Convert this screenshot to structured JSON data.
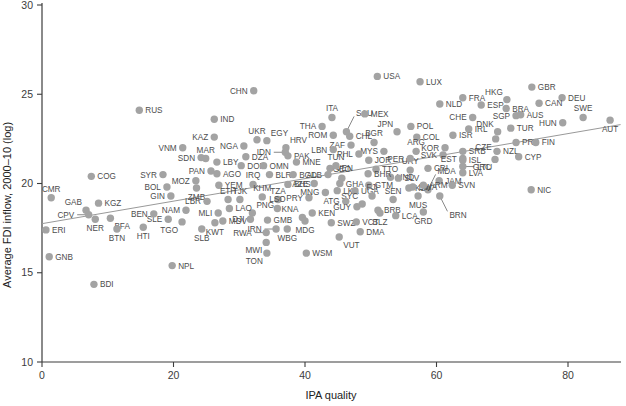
{
  "figure": {
    "x_axis_label": "IPA quality",
    "y_axis_label": "Average FDI inflow, 2000–10 (log)"
  },
  "chart_data": {
    "type": "scatter",
    "title": "",
    "xlabel": "IPA quality",
    "ylabel": "Average FDI inflow, 2000–10 (log)",
    "xlim": [
      0,
      88
    ],
    "ylim": [
      10,
      30
    ],
    "x_ticks": [
      0,
      20,
      40,
      60,
      80
    ],
    "y_ticks": [
      10,
      15,
      20,
      25,
      30
    ],
    "grid": false,
    "legend": "none",
    "dot_color": "#a3a3a3",
    "label_color": "#4d4d4d",
    "axis_color": "#3c3c3c",
    "trend_color": "#999999",
    "trend_line": {
      "x1": 0,
      "y1": 17.75,
      "x2": 88,
      "y2": 23.3
    },
    "points": [
      {
        "c": "ERI",
        "x": 0.6,
        "y": 17.4,
        "pos": "r"
      },
      {
        "c": "GNB",
        "x": 1.1,
        "y": 15.9,
        "pos": "r"
      },
      {
        "c": "CMR",
        "x": 1.4,
        "y": 19.2,
        "pos": "t"
      },
      {
        "c": "GAB",
        "x": 6.7,
        "y": 18.5,
        "pos": "tl"
      },
      {
        "c": "CPV",
        "x": 7.1,
        "y": 18.25,
        "pos": "l",
        "ld": true
      },
      {
        "c": "COG",
        "x": 7.5,
        "y": 20.4,
        "pos": "r"
      },
      {
        "c": "KGZ",
        "x": 8.6,
        "y": 18.9,
        "pos": "r"
      },
      {
        "c": "NER",
        "x": 8.1,
        "y": 18.0,
        "pos": "b"
      },
      {
        "c": "BFA",
        "x": 10.4,
        "y": 18.05,
        "pos": "br"
      },
      {
        "c": "BDI",
        "x": 7.9,
        "y": 14.35,
        "pos": "r"
      },
      {
        "c": "BTN",
        "x": 11.4,
        "y": 17.45,
        "pos": "b"
      },
      {
        "c": "HTI",
        "x": 15.4,
        "y": 17.55,
        "pos": "b"
      },
      {
        "c": "RUS",
        "x": 14.8,
        "y": 24.1,
        "pos": "r"
      },
      {
        "c": "SYR",
        "x": 18.4,
        "y": 20.5,
        "pos": "l"
      },
      {
        "c": "BOL",
        "x": 19.0,
        "y": 19.8,
        "pos": "l"
      },
      {
        "c": "GIN",
        "x": 19.6,
        "y": 19.3,
        "pos": "l"
      },
      {
        "c": "SLE",
        "x": 19.2,
        "y": 18.0,
        "pos": "l"
      },
      {
        "c": "BEN",
        "x": 17.0,
        "y": 18.3,
        "pos": "l"
      },
      {
        "c": "NAM",
        "x": 21.9,
        "y": 18.5,
        "pos": "l"
      },
      {
        "c": "VNM",
        "x": 21.4,
        "y": 22.0,
        "pos": "l"
      },
      {
        "c": "NPL",
        "x": 19.8,
        "y": 15.4,
        "pos": "r"
      },
      {
        "c": "TGO",
        "x": 21.3,
        "y": 17.85,
        "pos": "bl"
      },
      {
        "c": "SLB",
        "x": 24.3,
        "y": 17.45,
        "pos": "b"
      },
      {
        "c": "MOZ",
        "x": 23.4,
        "y": 20.15,
        "pos": "l"
      },
      {
        "c": "ZMB",
        "x": 23.5,
        "y": 19.75,
        "pos": "b"
      },
      {
        "c": "LBR",
        "x": 25.1,
        "y": 19.0,
        "pos": "l"
      },
      {
        "c": "MLI",
        "x": 26.8,
        "y": 18.35,
        "pos": "l"
      },
      {
        "c": "KWT",
        "x": 26.3,
        "y": 17.8,
        "pos": "b"
      },
      {
        "c": "MDV",
        "x": 27.5,
        "y": 17.9,
        "pos": "r"
      },
      {
        "c": "PAN",
        "x": 25.7,
        "y": 20.7,
        "pos": "l"
      },
      {
        "c": "AGO",
        "x": 26.6,
        "y": 20.55,
        "pos": "r"
      },
      {
        "c": "YEM",
        "x": 26.9,
        "y": 19.9,
        "pos": "r"
      },
      {
        "c": "MAR",
        "x": 24.9,
        "y": 21.4,
        "pos": "t"
      },
      {
        "c": "SDN",
        "x": 24.2,
        "y": 21.45,
        "pos": "l"
      },
      {
        "c": "LBY",
        "x": 26.6,
        "y": 21.2,
        "pos": "r"
      },
      {
        "c": "KAZ",
        "x": 26.2,
        "y": 22.6,
        "pos": "l"
      },
      {
        "c": "IND",
        "x": 26.2,
        "y": 23.6,
        "pos": "r"
      },
      {
        "c": "CHN",
        "x": 32.2,
        "y": 25.2,
        "pos": "l"
      },
      {
        "c": "NGA",
        "x": 30.7,
        "y": 22.1,
        "pos": "l"
      },
      {
        "c": "UKR",
        "x": 32.7,
        "y": 22.45,
        "pos": "t"
      },
      {
        "c": "EGY",
        "x": 34.2,
        "y": 22.4,
        "pos": "tr"
      },
      {
        "c": "DZA",
        "x": 31.0,
        "y": 21.5,
        "pos": "r"
      },
      {
        "c": "DOM",
        "x": 30.3,
        "y": 21.0,
        "pos": "r"
      },
      {
        "c": "IDN",
        "x": 37.0,
        "y": 21.75,
        "pos": "l",
        "ld": true
      },
      {
        "c": "HRV",
        "x": 37.1,
        "y": 22.0,
        "pos": "tr"
      },
      {
        "c": "PAK",
        "x": 37.4,
        "y": 21.55,
        "pos": "r"
      },
      {
        "c": "OMN",
        "x": 33.7,
        "y": 21.0,
        "pos": "r"
      },
      {
        "c": "MNE",
        "x": 38.7,
        "y": 21.2,
        "pos": "r"
      },
      {
        "c": "BLR",
        "x": 34.6,
        "y": 20.5,
        "pos": "r"
      },
      {
        "c": "BGD",
        "x": 38.2,
        "y": 20.5,
        "pos": "r"
      },
      {
        "c": "IRQ",
        "x": 32.1,
        "y": 19.95,
        "pos": "t"
      },
      {
        "c": "ETH",
        "x": 28.3,
        "y": 19.1,
        "pos": "t"
      },
      {
        "c": "TJK",
        "x": 30.1,
        "y": 19.1,
        "pos": "t"
      },
      {
        "c": "KHM",
        "x": 33.5,
        "y": 19.25,
        "pos": "t"
      },
      {
        "c": "TZA",
        "x": 35.9,
        "y": 19.1,
        "pos": "t"
      },
      {
        "c": "LSO",
        "x": 35.8,
        "y": 18.6,
        "pos": "t"
      },
      {
        "c": "PNG",
        "x": 32.0,
        "y": 18.35,
        "pos": "tr"
      },
      {
        "c": "LAO",
        "x": 28.5,
        "y": 18.6,
        "pos": "r"
      },
      {
        "c": "DJI",
        "x": 31.7,
        "y": 18.0,
        "pos": "l"
      },
      {
        "c": "GMB",
        "x": 34.3,
        "y": 17.95,
        "pos": "r"
      },
      {
        "c": "KNA",
        "x": 39.6,
        "y": 18.1,
        "pos": "tl"
      },
      {
        "c": "IRN",
        "x": 35.6,
        "y": 17.45,
        "pos": "l",
        "ld": true
      },
      {
        "c": "RWA",
        "x": 34.1,
        "y": 17.25,
        "pos": "l",
        "ld": true
      },
      {
        "c": "WBG",
        "x": 37.3,
        "y": 17.45,
        "pos": "b"
      },
      {
        "c": "MWI",
        "x": 34.1,
        "y": 16.7,
        "pos": "bl"
      },
      {
        "c": "TON",
        "x": 34.2,
        "y": 16.1,
        "pos": "bl"
      },
      {
        "c": "WSM",
        "x": 40.2,
        "y": 16.1,
        "pos": "r"
      },
      {
        "c": "MDG",
        "x": 40.0,
        "y": 17.9,
        "pos": "b"
      },
      {
        "c": "PRY",
        "x": 40.6,
        "y": 19.2,
        "pos": "l"
      },
      {
        "c": "KEN",
        "x": 41.1,
        "y": 18.35,
        "pos": "r"
      },
      {
        "c": "MNG",
        "x": 43.1,
        "y": 19.5,
        "pos": "l"
      },
      {
        "c": "AZE",
        "x": 41.4,
        "y": 20.0,
        "pos": "l"
      },
      {
        "c": "BHS",
        "x": 37.4,
        "y": 19.95,
        "pos": "r"
      },
      {
        "c": "ALB",
        "x": 43.5,
        "y": 20.5,
        "pos": "l"
      },
      {
        "c": "GEO",
        "x": 45.6,
        "y": 20.3,
        "pos": "t"
      },
      {
        "c": "GHA",
        "x": 45.3,
        "y": 20.0,
        "pos": "r"
      },
      {
        "c": "LKA",
        "x": 44.9,
        "y": 19.6,
        "pos": "r"
      },
      {
        "c": "UGA",
        "x": 47.6,
        "y": 19.6,
        "pos": "r"
      },
      {
        "c": "GTM",
        "x": 49.7,
        "y": 19.9,
        "pos": "r"
      },
      {
        "c": "FJI",
        "x": 50.2,
        "y": 19.3,
        "pos": "t"
      },
      {
        "c": "SEN",
        "x": 53.4,
        "y": 19.1,
        "pos": "t"
      },
      {
        "c": "SYC",
        "x": 48.7,
        "y": 18.85,
        "pos": "tl"
      },
      {
        "c": "ATG",
        "x": 46.2,
        "y": 19.0,
        "pos": "l"
      },
      {
        "c": "GUY",
        "x": 47.9,
        "y": 18.7,
        "pos": "l"
      },
      {
        "c": "SWZ",
        "x": 44.0,
        "y": 17.8,
        "pos": "r"
      },
      {
        "c": "VCT",
        "x": 47.8,
        "y": 17.85,
        "pos": "r"
      },
      {
        "c": "VUT",
        "x": 45.2,
        "y": 17.0,
        "pos": "br"
      },
      {
        "c": "DMA",
        "x": 48.4,
        "y": 17.3,
        "pos": "r"
      },
      {
        "c": "BRB",
        "x": 51.1,
        "y": 18.5,
        "pos": "r"
      },
      {
        "c": "BLZ",
        "x": 51.4,
        "y": 18.35,
        "pos": "b"
      },
      {
        "c": "LCA",
        "x": 53.8,
        "y": 18.2,
        "pos": "r"
      },
      {
        "c": "GRD",
        "x": 58.0,
        "y": 18.4,
        "pos": "b"
      },
      {
        "c": "MUS",
        "x": 57.2,
        "y": 19.3,
        "pos": "b"
      },
      {
        "c": "BRN",
        "x": 60.5,
        "y": 19.3,
        "pos": "br",
        "ld": true
      },
      {
        "c": "MDA",
        "x": 58.7,
        "y": 19.65,
        "pos": "tr",
        "ld": true
      },
      {
        "c": "KSV",
        "x": 55.8,
        "y": 19.75,
        "pos": "r"
      },
      {
        "c": "BWA",
        "x": 56.4,
        "y": 19.8,
        "pos": "r"
      },
      {
        "c": "HND",
        "x": 53.0,
        "y": 20.35,
        "pos": "r"
      },
      {
        "c": "SLV",
        "x": 54.2,
        "y": 20.3,
        "pos": "r"
      },
      {
        "c": "JAM",
        "x": 60.4,
        "y": 20.15,
        "pos": "r"
      },
      {
        "c": "ARM",
        "x": 58.0,
        "y": 19.9,
        "pos": "r"
      },
      {
        "c": "SVN",
        "x": 62.4,
        "y": 19.9,
        "pos": "r"
      },
      {
        "c": "NIC",
        "x": 74.4,
        "y": 19.65,
        "pos": "r"
      },
      {
        "c": "URY",
        "x": 56.0,
        "y": 20.75,
        "pos": "t"
      },
      {
        "c": "CRI",
        "x": 58.7,
        "y": 20.85,
        "pos": "r"
      },
      {
        "c": "TTO",
        "x": 50.8,
        "y": 20.8,
        "pos": "r"
      },
      {
        "c": "VEN",
        "x": 43.8,
        "y": 20.85,
        "pos": "r"
      },
      {
        "c": "TUN",
        "x": 44.7,
        "y": 21.0,
        "pos": "t"
      },
      {
        "c": "JOR",
        "x": 49.7,
        "y": 21.3,
        "pos": "r"
      },
      {
        "c": "BHR",
        "x": 49.6,
        "y": 20.55,
        "pos": "r"
      },
      {
        "c": "PER",
        "x": 56.0,
        "y": 21.4,
        "pos": "l"
      },
      {
        "c": "MYS",
        "x": 52.0,
        "y": 21.8,
        "pos": "l"
      },
      {
        "c": "PHL",
        "x": 48.2,
        "y": 21.65,
        "pos": "l"
      },
      {
        "c": "ZAF",
        "x": 47.0,
        "y": 22.15,
        "pos": "l"
      },
      {
        "c": "LBN",
        "x": 44.3,
        "y": 21.9,
        "pos": "l"
      },
      {
        "c": "CHL",
        "x": 46.8,
        "y": 22.65,
        "pos": "r"
      },
      {
        "c": "SAU",
        "x": 46.3,
        "y": 22.9,
        "pos": "tr",
        "ld": true
      },
      {
        "c": "ROM",
        "x": 44.3,
        "y": 22.7,
        "pos": "l"
      },
      {
        "c": "THA",
        "x": 42.6,
        "y": 23.2,
        "pos": "l"
      },
      {
        "c": "ITA",
        "x": 44.1,
        "y": 23.7,
        "pos": "t"
      },
      {
        "c": "MEX",
        "x": 49.1,
        "y": 23.9,
        "pos": "r"
      },
      {
        "c": "BGR",
        "x": 50.5,
        "y": 22.3,
        "pos": "t"
      },
      {
        "c": "JPN",
        "x": 54.0,
        "y": 22.9,
        "pos": "tl"
      },
      {
        "c": "POL",
        "x": 56.1,
        "y": 23.2,
        "pos": "r"
      },
      {
        "c": "COL",
        "x": 57.0,
        "y": 22.6,
        "pos": "r"
      },
      {
        "c": "ARG",
        "x": 56.9,
        "y": 21.8,
        "pos": "t"
      },
      {
        "c": "SVK",
        "x": 61.0,
        "y": 21.6,
        "pos": "l"
      },
      {
        "c": "EST",
        "x": 64.0,
        "y": 21.4,
        "pos": "l"
      },
      {
        "c": "KOR",
        "x": 61.3,
        "y": 22.0,
        "pos": "l"
      },
      {
        "c": "ISR",
        "x": 62.5,
        "y": 22.7,
        "pos": "r"
      },
      {
        "c": "CZE",
        "x": 69.0,
        "y": 22.5,
        "pos": "bl"
      },
      {
        "c": "SRB",
        "x": 64.0,
        "y": 21.8,
        "pos": "r"
      },
      {
        "c": "LVA",
        "x": 64.0,
        "y": 20.6,
        "pos": "r"
      },
      {
        "c": "LTU",
        "x": 64.0,
        "y": 20.95,
        "pos": "r",
        "ld": true
      },
      {
        "c": "ISL",
        "x": 64.0,
        "y": 21.3,
        "pos": "r"
      },
      {
        "c": "GRC",
        "x": 68.9,
        "y": 21.35,
        "pos": "bl"
      },
      {
        "c": "NZL",
        "x": 69.2,
        "y": 21.8,
        "pos": "r"
      },
      {
        "c": "CYP",
        "x": 72.5,
        "y": 21.5,
        "pos": "r"
      },
      {
        "c": "PRT",
        "x": 72.1,
        "y": 22.3,
        "pos": "r"
      },
      {
        "c": "FIN",
        "x": 75.1,
        "y": 22.3,
        "pos": "r"
      },
      {
        "c": "TUR",
        "x": 71.3,
        "y": 23.1,
        "pos": "r"
      },
      {
        "c": "DNK",
        "x": 69.3,
        "y": 22.9,
        "pos": "tl"
      },
      {
        "c": "IRL",
        "x": 64.9,
        "y": 23.05,
        "pos": "r"
      },
      {
        "c": "CHE",
        "x": 65.5,
        "y": 23.7,
        "pos": "l"
      },
      {
        "c": "SGP",
        "x": 72.1,
        "y": 23.8,
        "pos": "l"
      },
      {
        "c": "AUS",
        "x": 72.8,
        "y": 23.85,
        "pos": "r"
      },
      {
        "c": "HUN",
        "x": 79.2,
        "y": 23.4,
        "pos": "l"
      },
      {
        "c": "SWE",
        "x": 82.3,
        "y": 23.7,
        "pos": "t"
      },
      {
        "c": "AUT",
        "x": 86.4,
        "y": 23.55,
        "pos": "b"
      },
      {
        "c": "DEU",
        "x": 79.1,
        "y": 24.8,
        "pos": "r"
      },
      {
        "c": "CAN",
        "x": 75.6,
        "y": 24.5,
        "pos": "r"
      },
      {
        "c": "BRA",
        "x": 70.6,
        "y": 24.2,
        "pos": "r"
      },
      {
        "c": "HKG",
        "x": 70.7,
        "y": 24.7,
        "pos": "tl"
      },
      {
        "c": "GBR",
        "x": 74.5,
        "y": 25.4,
        "pos": "r"
      },
      {
        "c": "ESP",
        "x": 66.8,
        "y": 24.4,
        "pos": "r"
      },
      {
        "c": "FRA",
        "x": 64.0,
        "y": 24.8,
        "pos": "r"
      },
      {
        "c": "NLD",
        "x": 60.5,
        "y": 24.45,
        "pos": "r"
      },
      {
        "c": "LUX",
        "x": 57.5,
        "y": 25.7,
        "pos": "r"
      },
      {
        "c": "USA",
        "x": 51.0,
        "y": 26.0,
        "pos": "r"
      }
    ]
  }
}
